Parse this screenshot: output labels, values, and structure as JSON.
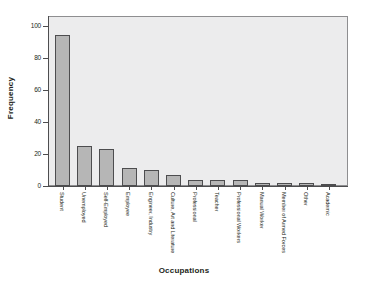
{
  "chart_data": {
    "type": "bar",
    "title": "",
    "xlabel": "Occupations",
    "ylabel": "Frequency",
    "categories": [
      "Student",
      "Unemployed",
      "Self-Employed",
      "Employee",
      "Engineer, Industry",
      "Culture, Art and Literature",
      "Professional",
      "Teacher",
      "Professional Workers",
      "Manual Worker",
      "Member of Armed Forces",
      "Other",
      "Academic"
    ],
    "values": [
      94,
      25,
      23,
      11,
      10,
      7,
      4,
      4,
      4,
      2,
      2,
      2,
      1
    ],
    "ylim": [
      0,
      100
    ],
    "yticks": [
      0,
      20,
      40,
      60,
      80,
      100
    ],
    "ytick_labels": [
      "0",
      "20",
      "40",
      "60",
      "80",
      "100"
    ],
    "grid": false,
    "legend": "none",
    "bar_color": "#b6b6b6",
    "bar_edge_color": "#4d4d4f",
    "plot_background": "#ececed",
    "figure_background": "#ffffff",
    "axis_color": "#4d4d4f",
    "text_color": "#231f20"
  }
}
